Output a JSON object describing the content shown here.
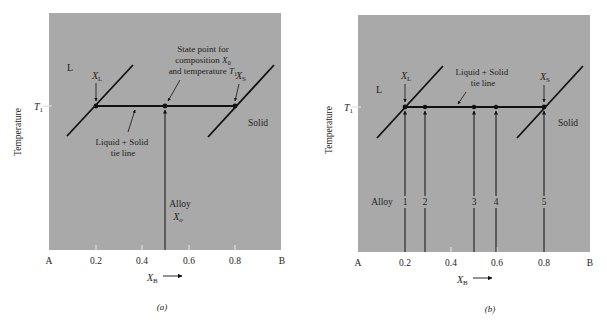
{
  "figure": {
    "panels": [
      {
        "id": "a",
        "label": "(a)",
        "y_axis_label": "Temperature",
        "temperature_label": "T",
        "temperature_sub": "1",
        "x_axis": {
          "var": "X",
          "var_sub": "B",
          "ticks": [
            "A",
            "0.2",
            "0.4",
            "0.6",
            "0.8",
            "B"
          ]
        },
        "region_liquid": "L",
        "region_solid": "Solid",
        "xl_label": "X",
        "xl_sub": "L",
        "xs_label": "X",
        "xs_sub": "S",
        "annotation_state_point": [
          "State point for",
          "composition X",
          "and temperature T"
        ],
        "annotation_state_subs": [
          "0",
          "1"
        ],
        "annotation_tie_line": [
          "Liquid + Solid",
          "tie line"
        ],
        "alloy_label": "Alloy",
        "alloy_comp": "X",
        "alloy_comp_sub": "o"
      },
      {
        "id": "b",
        "label": "(b)",
        "y_axis_label": "Temperature",
        "temperature_label": "T",
        "temperature_sub": "1",
        "x_axis": {
          "var": "X",
          "var_sub": "B",
          "ticks": [
            "A",
            "0.2",
            "0.4",
            "0.6",
            "0.8",
            "B"
          ]
        },
        "region_liquid": "L",
        "region_solid": "Solid",
        "xl_label": "X",
        "xl_sub": "L",
        "xs_label": "X",
        "xs_sub": "S",
        "annotation_tie_line": [
          "Liquid + Solid",
          "tie line"
        ],
        "alloy_label": "Alloy",
        "alloys": [
          "1",
          "2",
          "3",
          "4",
          "5"
        ]
      }
    ],
    "colors": {
      "plot_bg": "#a9a9a9",
      "line": "#111111",
      "tick": "#e8e8e8"
    }
  }
}
